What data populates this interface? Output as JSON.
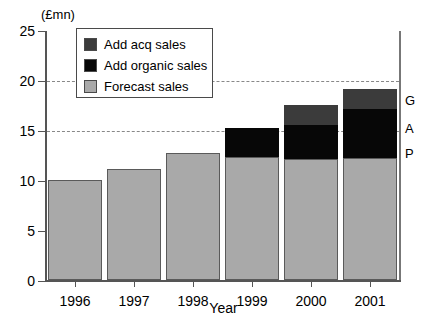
{
  "chart_data": {
    "type": "bar",
    "subtype": "stacked-bar",
    "title": "",
    "unit_caption": "(£mn)",
    "xlabel": "Year",
    "ylabel": "",
    "categories": [
      "1996",
      "1997",
      "1998",
      "1999",
      "2000",
      "2001"
    ],
    "series": [
      {
        "name": "Forecast sales",
        "color": "#a9a9a9",
        "values": [
          10.0,
          11.1,
          12.7,
          12.3,
          12.1,
          12.2
        ]
      },
      {
        "name": "Add organic sales",
        "color": "#070707",
        "values": [
          0,
          0,
          0,
          2.9,
          3.4,
          4.9
        ]
      },
      {
        "name": "Add acq sales",
        "color": "#3b3b3b",
        "values": [
          0,
          0,
          0,
          0,
          2.0,
          2.0
        ]
      }
    ],
    "totals": [
      10.0,
      11.1,
      12.7,
      15.2,
      17.5,
      19.1
    ],
    "ylim": [
      0,
      25
    ],
    "yticks": [
      0,
      5,
      10,
      15,
      20,
      25
    ],
    "ytick_labels": [
      "0",
      "5",
      "10",
      "15",
      "20",
      "25"
    ],
    "gridlines_at": [
      15,
      20
    ],
    "grid": true,
    "legend_position": "top-left-inside",
    "annotations": [
      {
        "text": "G",
        "value": 18.1,
        "meaning": "acq segment marker"
      },
      {
        "text": "A",
        "value": 15.3,
        "meaning": "organic segment marker"
      },
      {
        "text": "P",
        "value": 12.8,
        "meaning": "forecast segment marker"
      }
    ]
  },
  "legend": {
    "items": [
      {
        "label": "Add acq sales",
        "swatch": "#3b3b3b"
      },
      {
        "label": "Add organic sales",
        "swatch": "#070707"
      },
      {
        "label": "Forecast sales",
        "swatch": "#a9a9a9"
      }
    ]
  }
}
